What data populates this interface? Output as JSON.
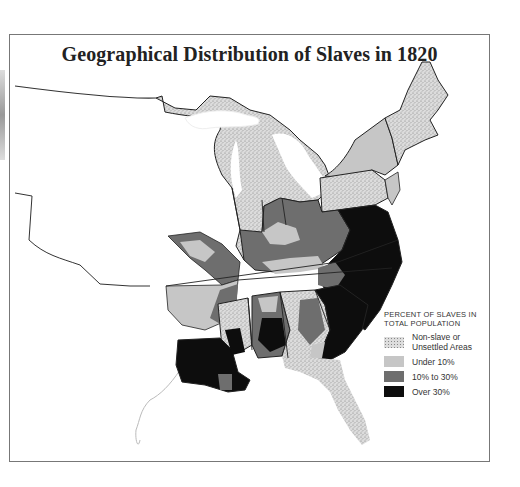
{
  "header": {
    "top_text_fragment": "typ... ...t ...p... ...y ..."
  },
  "map": {
    "title": "Geographical Distribution of Slaves in 1820",
    "colors": {
      "non_slave": "#d9d9d9",
      "under_10": "#c4c4c4",
      "ten_to_30": "#6e6e6e",
      "over_30": "#0d0d0d",
      "border": "#222222",
      "frame": "#777777"
    }
  },
  "legend": {
    "heading_line1": "PERCENT OF SLAVES IN",
    "heading_line2": "TOTAL POPULATION",
    "items": [
      {
        "label_line1": "Non-slave or",
        "label_line2": "Unsettled Areas",
        "key": "non_slave"
      },
      {
        "label_line1": "Under 10%",
        "label_line2": "",
        "key": "under_10"
      },
      {
        "label_line1": "10% to 30%",
        "label_line2": "",
        "key": "ten_to_30"
      },
      {
        "label_line1": "Over 30%",
        "label_line2": "",
        "key": "over_30"
      }
    ]
  }
}
